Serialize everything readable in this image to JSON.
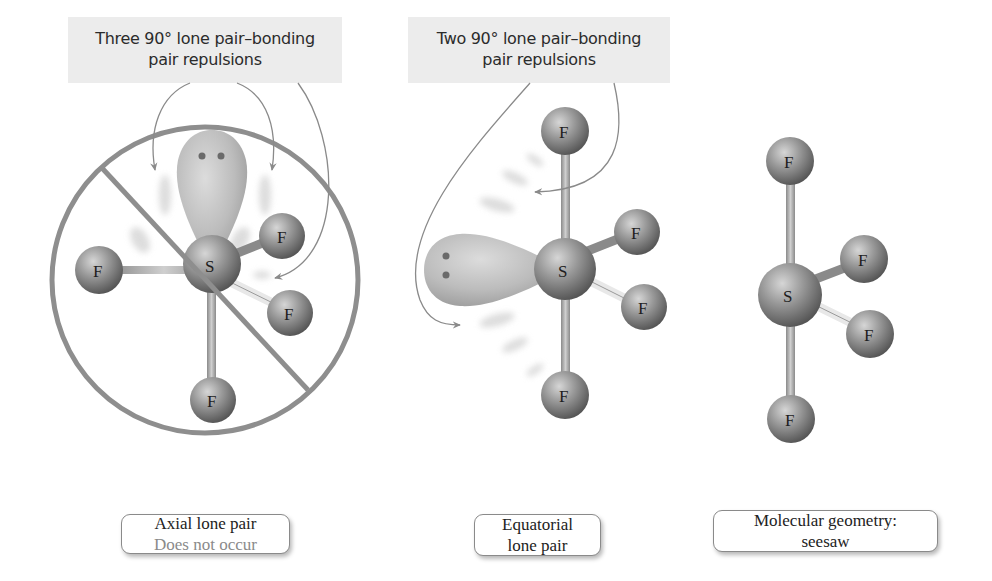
{
  "callouts": {
    "left": {
      "line1": "Three 90° lone pair–bonding",
      "line2": "pair repulsions"
    },
    "middle": {
      "line1": "Two 90° lone pair–bonding",
      "line2": "pair repulsions"
    }
  },
  "molecules": [
    {
      "id": "axial",
      "central_atom": "S",
      "ligands": [
        "F",
        "F",
        "F",
        "F"
      ],
      "lone_pair_position": "axial",
      "crossed_out": true,
      "label": {
        "line1": "Axial lone pair",
        "line2": "Does not occur"
      }
    },
    {
      "id": "equatorial",
      "central_atom": "S",
      "ligands": [
        "F",
        "F",
        "F",
        "F"
      ],
      "lone_pair_position": "equatorial",
      "crossed_out": false,
      "label": {
        "line1": "Equatorial",
        "line2": "lone pair"
      }
    },
    {
      "id": "seesaw",
      "central_atom": "S",
      "ligands": [
        "F",
        "F",
        "F",
        "F"
      ],
      "lone_pair_position": "none shown",
      "crossed_out": false,
      "label": {
        "line1": "Molecular geometry:",
        "line2": "seesaw"
      }
    }
  ],
  "colors": {
    "callout_bg": "#ececec",
    "prohibition_sign": "#8e8e8e",
    "atom": "#8c8c8c",
    "lone_pair_lobe": "#bdbdbd",
    "arrow": "#8a8a8a",
    "muted_text": "#8a8a8a"
  }
}
